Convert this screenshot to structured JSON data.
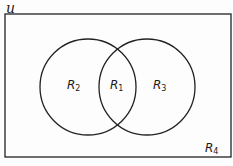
{
  "diagram": {
    "type": "venn",
    "universe_label": "u",
    "sets": 2,
    "colors": {
      "stroke": "#222222",
      "background": "#fdfdfd"
    },
    "regions": [
      {
        "id": "R1",
        "base": "R",
        "sub": "1",
        "description": "intersection"
      },
      {
        "id": "R2",
        "base": "R",
        "sub": "2",
        "description": "left circle only"
      },
      {
        "id": "R3",
        "base": "R",
        "sub": "3",
        "description": "right circle only"
      },
      {
        "id": "R4",
        "base": "R",
        "sub": "4",
        "description": "outside both circles"
      }
    ]
  }
}
